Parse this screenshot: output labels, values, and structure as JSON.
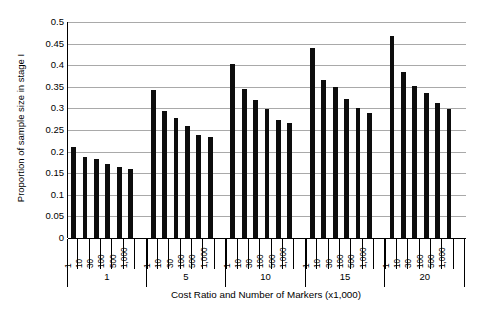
{
  "chart_data": {
    "type": "bar",
    "title": "",
    "xlabel": "Cost Ratio and Number of Markers (x1,000)",
    "ylabel": "Proportion of sample size in stage I",
    "ylim": [
      0,
      0.5
    ],
    "ytick_labels": [
      "0.5",
      "0.45",
      "0.4",
      "0.35",
      "0.3",
      "0.25",
      "0.2",
      "0.15",
      "0.1",
      "0.05",
      "0"
    ],
    "ytick_values": [
      0.5,
      0.45,
      0.4,
      0.35,
      0.3,
      0.25,
      0.2,
      0.15,
      0.1,
      0.05,
      0
    ],
    "grid": true,
    "legend": "none",
    "marker_labels": [
      "1",
      "10",
      "30",
      "100",
      "500",
      "1,000"
    ],
    "groups": [
      {
        "group_label": "1",
        "categories": [
          "1",
          "10",
          "30",
          "100",
          "500",
          "1,000"
        ],
        "values": [
          0.211,
          0.187,
          0.183,
          0.171,
          0.165,
          0.16
        ]
      },
      {
        "group_label": "5",
        "categories": [
          "1",
          "10",
          "30",
          "100",
          "500",
          "1,000"
        ],
        "values": [
          0.343,
          0.293,
          0.277,
          0.259,
          0.239,
          0.234
        ]
      },
      {
        "group_label": "10",
        "categories": [
          "1",
          "10",
          "30",
          "100",
          "500",
          "1,000"
        ],
        "values": [
          0.402,
          0.345,
          0.32,
          0.298,
          0.273,
          0.266
        ]
      },
      {
        "group_label": "15",
        "categories": [
          "1",
          "10",
          "30",
          "100",
          "500",
          "1,000"
        ],
        "values": [
          0.439,
          0.366,
          0.349,
          0.322,
          0.3,
          0.29
        ]
      },
      {
        "group_label": "20",
        "categories": [
          "1",
          "10",
          "30",
          "100",
          "500",
          "1,000"
        ],
        "values": [
          0.467,
          0.385,
          0.352,
          0.335,
          0.312,
          0.298
        ]
      }
    ],
    "bar_color": "#0d0d0d",
    "grid_color": "#a9a9a9",
    "axis_color": "#000000"
  }
}
